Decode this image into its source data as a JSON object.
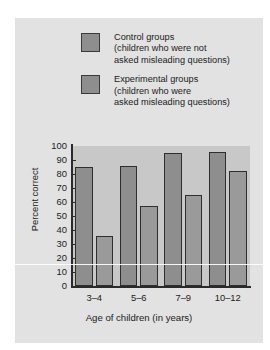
{
  "chart_data": {
    "type": "bar",
    "title": "",
    "xlabel": "Age of children (in years)",
    "ylabel": "Percent correct",
    "categories": [
      "3–4",
      "5–6",
      "7–9",
      "10–12"
    ],
    "series": [
      {
        "name": "Control groups",
        "sublabel_line1": "(children who were not",
        "sublabel_line2": "asked misleading questions)",
        "color": "#8e8e8e",
        "values": [
          85,
          86,
          95,
          96
        ]
      },
      {
        "name": "Experimental groups",
        "sublabel_line1": "(children who were",
        "sublabel_line2": "asked misleading questions)",
        "color": "#9a9a9a",
        "values": [
          36,
          57,
          65,
          82
        ]
      }
    ],
    "ylim": [
      0,
      100
    ],
    "yticks": [
      100,
      90,
      80,
      70,
      60,
      50,
      40,
      30,
      20,
      10,
      0
    ],
    "grid": false,
    "legend_position": "top"
  },
  "colors": {
    "figure_background": "#e2e2e2",
    "plot_background": "#c8c8c8",
    "axis": "#2e2e2e",
    "text": "#1b1b1b"
  }
}
